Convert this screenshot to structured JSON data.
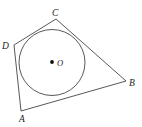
{
  "figure": {
    "width": 142,
    "height": 127,
    "background_color": "#ffffff",
    "stroke_color": "#3a3a3a",
    "label_color": "#1a1a1a",
    "polygon": {
      "name": "quadrilateral-ABCD",
      "vertex_order": [
        "A",
        "B",
        "C",
        "D"
      ],
      "points": "21,111 126,81 56,19 14,45",
      "vertices": [
        {
          "label": "A",
          "x": 21,
          "y": 111,
          "label_x": 19,
          "label_y": 122
        },
        {
          "label": "B",
          "x": 126,
          "y": 81,
          "label_x": 129,
          "label_y": 86
        },
        {
          "label": "C",
          "x": 56,
          "y": 19,
          "label_x": 52,
          "label_y": 16
        },
        {
          "label": "D",
          "x": 14,
          "y": 45,
          "label_x": 2,
          "label_y": 49
        }
      ]
    },
    "incircle": {
      "name": "inscribed-circle",
      "center_label": "O",
      "cx": 52,
      "cy": 62.5,
      "r": 33,
      "center_dot_x": 52,
      "center_dot_y": 62,
      "center_dot_r": 1.9,
      "center_label_x": 57,
      "center_label_y": 66
    }
  }
}
